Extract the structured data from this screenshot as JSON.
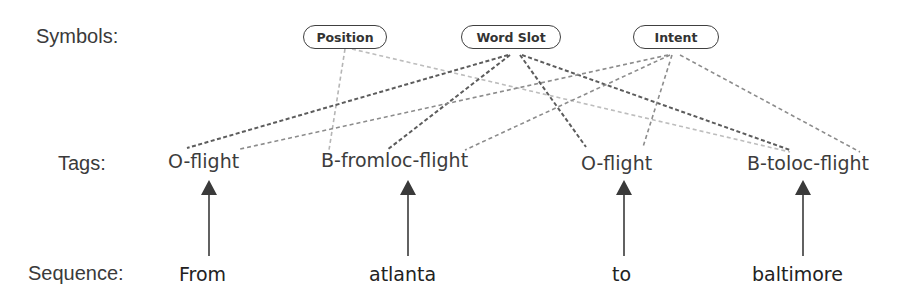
{
  "labels": {
    "symbols": "Symbols:",
    "tags": "Tags:",
    "sequence": "Sequence:"
  },
  "symbols": [
    {
      "id": "position",
      "label": "Position"
    },
    {
      "id": "word_slot",
      "label": "Word Slot"
    },
    {
      "id": "intent",
      "label": "Intent"
    }
  ],
  "tags": [
    {
      "label": "O-flight"
    },
    {
      "label": "B-fromloc-flight"
    },
    {
      "label": "O-flight"
    },
    {
      "label": "B-toloc-flight"
    }
  ],
  "sequence": [
    {
      "word": "From"
    },
    {
      "word": "atlanta"
    },
    {
      "word": "to"
    },
    {
      "word": "baltimore"
    }
  ],
  "connections": [
    {
      "from": "position",
      "to_tag": 1,
      "style": "light"
    },
    {
      "from": "position",
      "to_tag": 3,
      "style": "light"
    },
    {
      "from": "word_slot",
      "to_tag": 0,
      "style": "dark"
    },
    {
      "from": "word_slot",
      "to_tag": 1,
      "style": "dark"
    },
    {
      "from": "word_slot",
      "to_tag": 2,
      "style": "dark"
    },
    {
      "from": "word_slot",
      "to_tag": 3,
      "style": "dark"
    },
    {
      "from": "intent",
      "to_tag": 0,
      "style": "medium"
    },
    {
      "from": "intent",
      "to_tag": 1,
      "style": "medium"
    },
    {
      "from": "intent",
      "to_tag": 2,
      "style": "medium"
    },
    {
      "from": "intent",
      "to_tag": 3,
      "style": "medium"
    }
  ],
  "colors": {
    "light_line": "#b8b8b8",
    "medium_line": "#8a8a8a",
    "dark_line": "#5a5a5a",
    "arrow": "#3a3a3a"
  }
}
